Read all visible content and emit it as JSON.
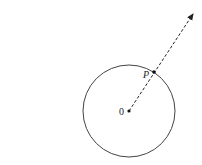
{
  "diagram": {
    "type": "circle-with-ray",
    "circle": {
      "cx": 129,
      "cy": 111,
      "r": 46,
      "stroke": "#444444"
    },
    "center": {
      "x": 129,
      "y": 111,
      "label": "0"
    },
    "point_p": {
      "x": 154,
      "y": 72,
      "label": "P"
    },
    "ray": {
      "from_x": 129,
      "from_y": 111,
      "to_x": 193,
      "to_y": 14,
      "style": "dashed",
      "arrow": true
    }
  }
}
